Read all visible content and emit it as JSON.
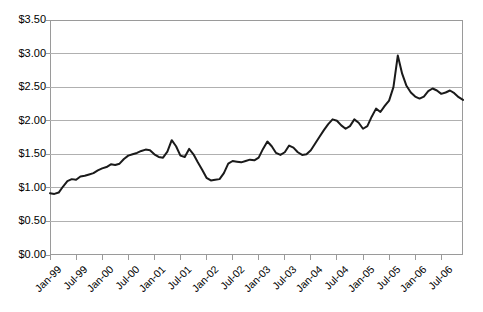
{
  "chart_data": {
    "type": "line",
    "title": "",
    "subtitle": "",
    "xlabel": "",
    "ylabel": "",
    "ylim": [
      0,
      3.5
    ],
    "ytick_step": 0.5,
    "grid": true,
    "grid_axis": "y",
    "legend": false,
    "legend_position": "none",
    "line_color": "#1a1a1a",
    "line_width": 2,
    "gridline_color": "#b0b0b0",
    "axis_color": "#9a9a9a",
    "y_tick_labels": [
      "$3.50",
      "$3.00",
      "$2.50",
      "$2.00",
      "$1.50",
      "$1.00",
      "$0.50",
      "$0.00"
    ],
    "y_tick_values": [
      3.5,
      3.0,
      2.5,
      2.0,
      1.5,
      1.0,
      0.5,
      0.0
    ],
    "x_tick_labels": [
      "Jan-99",
      "Jul-99",
      "Jan-00",
      "Jul-00",
      "Jan-01",
      "Jul-01",
      "Jan-02",
      "Jul-02",
      "Jan-03",
      "Jul-03",
      "Jan-04",
      "Jul-04",
      "Jan-05",
      "Jul-05",
      "Jan-06",
      "Jul-06"
    ],
    "x_tick_interval_months": 6,
    "x_start": "Jan-99",
    "x_end": "Dec-06",
    "categories": [
      "Jan-99",
      "Feb-99",
      "Mar-99",
      "Apr-99",
      "May-99",
      "Jun-99",
      "Jul-99",
      "Aug-99",
      "Sep-99",
      "Oct-99",
      "Nov-99",
      "Dec-99",
      "Jan-00",
      "Feb-00",
      "Mar-00",
      "Apr-00",
      "May-00",
      "Jun-00",
      "Jul-00",
      "Aug-00",
      "Sep-00",
      "Oct-00",
      "Nov-00",
      "Dec-00",
      "Jan-01",
      "Feb-01",
      "Mar-01",
      "Apr-01",
      "May-01",
      "Jun-01",
      "Jul-01",
      "Aug-01",
      "Sep-01",
      "Oct-01",
      "Nov-01",
      "Dec-01",
      "Jan-02",
      "Feb-02",
      "Mar-02",
      "Apr-02",
      "May-02",
      "Jun-02",
      "Jul-02",
      "Aug-02",
      "Sep-02",
      "Oct-02",
      "Nov-02",
      "Dec-02",
      "Jan-03",
      "Feb-03",
      "Mar-03",
      "Apr-03",
      "May-03",
      "Jun-03",
      "Jul-03",
      "Aug-03",
      "Sep-03",
      "Oct-03",
      "Nov-03",
      "Dec-03",
      "Jan-04",
      "Feb-04",
      "Mar-04",
      "Apr-04",
      "May-04",
      "Jun-04",
      "Jul-04",
      "Aug-04",
      "Sep-04",
      "Oct-04",
      "Nov-04",
      "Dec-04",
      "Jan-05",
      "Feb-05",
      "Mar-05",
      "Apr-05",
      "May-05",
      "Jun-05",
      "Jul-05",
      "Aug-05",
      "Sep-05",
      "Oct-05",
      "Nov-05",
      "Dec-05",
      "Jan-06",
      "Feb-06",
      "Mar-06",
      "Apr-06",
      "May-06",
      "Jun-06",
      "Jul-06",
      "Aug-06",
      "Sep-06",
      "Oct-06",
      "Nov-06",
      "Dec-06"
    ],
    "values": [
      0.92,
      0.91,
      0.93,
      1.02,
      1.1,
      1.13,
      1.12,
      1.17,
      1.18,
      1.2,
      1.22,
      1.26,
      1.29,
      1.31,
      1.35,
      1.34,
      1.36,
      1.43,
      1.48,
      1.5,
      1.52,
      1.55,
      1.57,
      1.56,
      1.5,
      1.46,
      1.45,
      1.54,
      1.71,
      1.62,
      1.48,
      1.46,
      1.58,
      1.5,
      1.38,
      1.27,
      1.15,
      1.11,
      1.12,
      1.13,
      1.22,
      1.36,
      1.4,
      1.39,
      1.38,
      1.4,
      1.42,
      1.41,
      1.45,
      1.58,
      1.69,
      1.62,
      1.52,
      1.49,
      1.53,
      1.63,
      1.6,
      1.53,
      1.49,
      1.5,
      1.56,
      1.66,
      1.76,
      1.86,
      1.95,
      2.02,
      2.0,
      1.93,
      1.88,
      1.92,
      2.02,
      1.97,
      1.88,
      1.92,
      2.06,
      2.18,
      2.13,
      2.22,
      2.3,
      2.5,
      2.97,
      2.7,
      2.52,
      2.42,
      2.36,
      2.33,
      2.36,
      2.44,
      2.48,
      2.45,
      2.4,
      2.42,
      2.45,
      2.41,
      2.35,
      2.31
    ]
  }
}
